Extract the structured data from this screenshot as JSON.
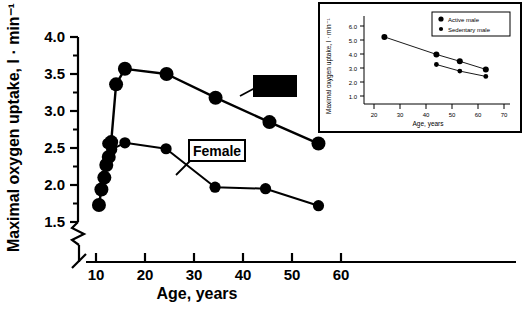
{
  "figure": {
    "background_color": "#ffffff",
    "line_color": "#000000",
    "marker_color": "#000000"
  },
  "chart_data": [
    {
      "id": "main",
      "type": "line",
      "title": "",
      "xlabel": "Age, years",
      "ylabel": "Maximal oxygen uptake, l · min⁻¹",
      "xlim": [
        8,
        60
      ],
      "ylim": [
        1.35,
        4.0
      ],
      "xticks": [
        10,
        20,
        30,
        40,
        50,
        60
      ],
      "xtick_labels": [
        "10",
        "20",
        "30",
        "40",
        "50",
        "60"
      ],
      "yticks": [
        1.5,
        2.0,
        2.5,
        3.0,
        3.5,
        4.0
      ],
      "ytick_labels": [
        "1.5",
        "2.0",
        "2.5",
        "3.0",
        "3.5",
        "4.0"
      ],
      "y_minor_ticks": [
        1.75,
        2.25,
        2.75,
        3.25,
        3.75
      ],
      "grid": false,
      "axis_break_x": true,
      "axis_break_y": true,
      "legend_position": "inline-annotations",
      "series": [
        {
          "name": "Male",
          "label_text": "Male",
          "label_style": "inverted-box",
          "x": [
            10.6,
            11.1,
            11.7,
            12.1,
            12.6,
            13.1,
            14.1,
            15.9,
            24.4,
            34.4,
            45.4,
            55.4
          ],
          "y": [
            1.73,
            1.94,
            2.1,
            2.27,
            2.38,
            2.58,
            3.36,
            3.57,
            3.5,
            3.18,
            2.85,
            2.56
          ]
        },
        {
          "name": "Female",
          "label_text": "Female",
          "label_style": "outlined-box",
          "x": [
            12.4,
            13.2,
            15.9,
            24.3,
            34.3,
            44.6,
            55.4
          ],
          "y": [
            2.56,
            2.48,
            2.57,
            2.49,
            1.97,
            1.95,
            1.72
          ]
        }
      ]
    },
    {
      "id": "inset",
      "type": "line",
      "title": "",
      "xlabel": "Age, years",
      "ylabel": "Maximal oxygen uptake, l · min⁻¹",
      "xlim": [
        16,
        72
      ],
      "ylim": [
        0.4,
        6.4
      ],
      "xticks": [
        20,
        30,
        40,
        50,
        60,
        70
      ],
      "xtick_labels": [
        "20",
        "30",
        "40",
        "50",
        "60",
        "70"
      ],
      "yticks": [
        1.0,
        2.0,
        3.0,
        4.0,
        5.0,
        6.0
      ],
      "ytick_labels": [
        "1.0",
        "2.0",
        "3.0",
        "4.0",
        "5.0",
        "6.0"
      ],
      "grid": false,
      "legend_position": "top-right",
      "series": [
        {
          "name": "Active male",
          "x": [
            24.0,
            44.0,
            53.0,
            63.0
          ],
          "y": [
            5.22,
            3.97,
            3.48,
            2.9
          ]
        },
        {
          "name": "Sedentary male",
          "x": [
            44.0,
            53.0,
            63.0
          ],
          "y": [
            3.25,
            2.78,
            2.4
          ]
        }
      ]
    }
  ]
}
